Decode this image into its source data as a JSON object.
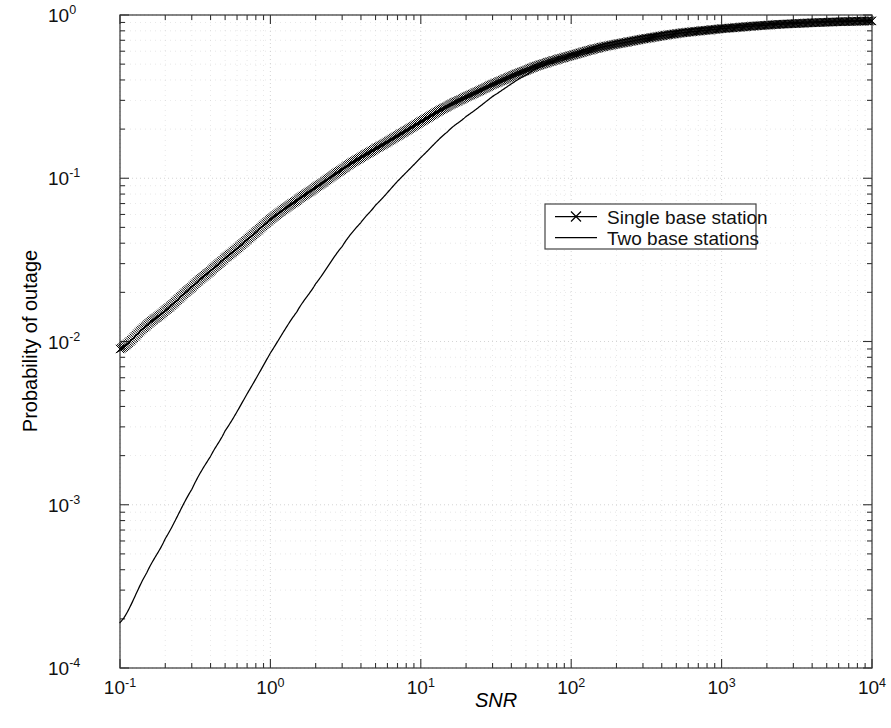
{
  "chart_data": {
    "type": "line",
    "title": "",
    "xlabel": "SNR",
    "ylabel": "Probability of outage",
    "xscale": "log",
    "yscale": "log",
    "xlim": [
      0.1,
      10000
    ],
    "ylim": [
      0.0001,
      1.0
    ],
    "grid": true,
    "grid_style": "dotted",
    "grid_color": "#c8c8c8",
    "legend_position": "center-right",
    "xticks": [
      0.1,
      1,
      10,
      100,
      1000,
      10000
    ],
    "xtick_labels": [
      "10-1",
      "100",
      "101",
      "102",
      "103",
      "104"
    ],
    "yticks": [
      0.0001,
      0.001,
      0.01,
      0.1,
      1
    ],
    "ytick_labels": [
      "10-4",
      "10-3",
      "10-2",
      "10-1",
      "100"
    ],
    "series": [
      {
        "name": "Single base station",
        "marker": "x",
        "linestyle": "-",
        "color": "#000000",
        "x": [
          0.1,
          0.15,
          0.2,
          0.3,
          0.4,
          0.5,
          0.7,
          1.0,
          1.5,
          2.0,
          3.0,
          4.0,
          5.0,
          7.0,
          10.0,
          15.0,
          20.0,
          30.0,
          50.0,
          70.0,
          100.0,
          150.0,
          200.0,
          300.0,
          500.0,
          700.0,
          1000.0,
          2000.0,
          3000.0,
          5000.0,
          7000.0,
          10000.0
        ],
        "y": [
          0.009,
          0.0125,
          0.0155,
          0.0215,
          0.027,
          0.0325,
          0.042,
          0.056,
          0.073,
          0.088,
          0.113,
          0.134,
          0.152,
          0.182,
          0.222,
          0.275,
          0.315,
          0.376,
          0.457,
          0.513,
          0.565,
          0.626,
          0.664,
          0.713,
          0.768,
          0.797,
          0.825,
          0.866,
          0.885,
          0.903,
          0.912,
          0.92
        ]
      },
      {
        "name": "Two base stations",
        "marker": "none",
        "linestyle": "-",
        "color": "#000000",
        "x": [
          0.1,
          0.15,
          0.2,
          0.3,
          0.4,
          0.5,
          0.7,
          1.0,
          1.5,
          2.0,
          3.0,
          4.0,
          5.0,
          7.0,
          10.0,
          15.0,
          20.0,
          30.0,
          50.0,
          70.0,
          100.0,
          150.0,
          200.0,
          300.0,
          500.0,
          700.0,
          1000.0,
          2000.0,
          3000.0,
          5000.0,
          7000.0,
          10000.0
        ],
        "y": [
          0.00019,
          0.00038,
          0.00062,
          0.00124,
          0.00198,
          0.00284,
          0.00478,
          0.0085,
          0.0152,
          0.0226,
          0.0382,
          0.0536,
          0.0684,
          0.0958,
          0.134,
          0.192,
          0.239,
          0.317,
          0.428,
          0.504,
          0.573,
          0.648,
          0.692,
          0.745,
          0.798,
          0.825,
          0.848,
          0.884,
          0.899,
          0.914,
          0.921,
          0.927
        ]
      }
    ]
  },
  "legend": {
    "items": [
      {
        "label": "Single base station",
        "marker": "x-marker"
      },
      {
        "label": "Two base stations",
        "marker": "line-only"
      }
    ]
  },
  "axes": {
    "x_label": "SNR",
    "y_label": "Probability of outage",
    "x_tick_mantissas": [
      "10",
      "10",
      "10",
      "10",
      "10",
      "10"
    ],
    "x_tick_exponents": [
      "-1",
      "0",
      "1",
      "2",
      "3",
      "4"
    ],
    "y_tick_mantissas": [
      "10",
      "10",
      "10",
      "10",
      "10"
    ],
    "y_tick_exponents": [
      "0",
      "-1",
      "-2",
      "-3",
      "-4"
    ]
  }
}
